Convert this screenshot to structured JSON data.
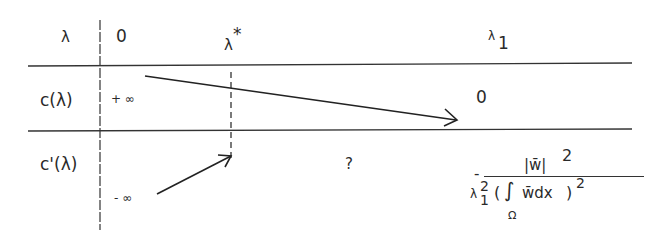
{
  "table": {
    "header_row": {
      "label": "λ",
      "values": [
        "0",
        "λ",
        "λ"
      ],
      "lambda_star_superscript": "*",
      "lambda_1_subscript": "1"
    },
    "rows": [
      {
        "label": "c(λ)",
        "start_value": "+ ∞",
        "end_value": "0",
        "trend": "decreasing"
      },
      {
        "label": "c'(λ)",
        "start_value": "- ∞",
        "middle_value": "?",
        "end_value": {
          "sign": "-",
          "numerator": "|w̄|",
          "numerator_exponent": "2",
          "denominator_lambda": "λ",
          "denominator_lambda_sub": "1",
          "denominator_lambda_sup": "2",
          "integral_body": "w̄dx",
          "integral_domain": "Ω",
          "integral_exponent": "2"
        },
        "trend": "increasing"
      }
    ]
  }
}
